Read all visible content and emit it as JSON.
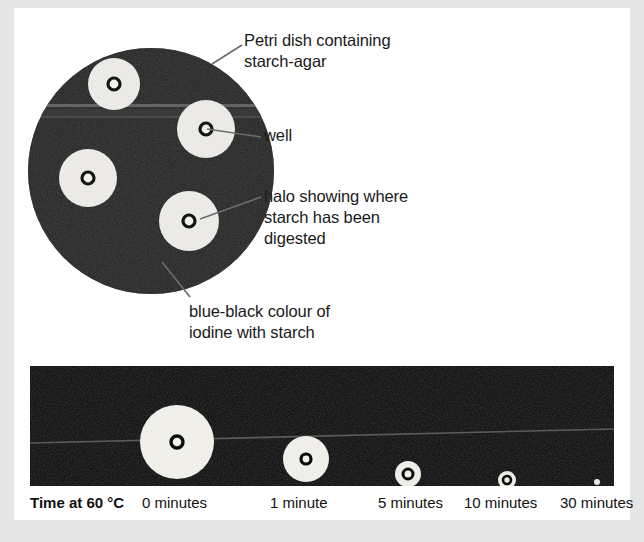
{
  "figure": {
    "colors": {
      "page_background": "#e6e6e6",
      "paper": "#ffffff",
      "agar_blue_black": "#141414",
      "halo_cream": "#ededea",
      "well_dark": "#111111",
      "text": "#1a1a1a",
      "leader_line": "#6d6d6d"
    }
  },
  "diagram": {
    "dish": {
      "center_x": 137,
      "center_y": 163,
      "radius": 123,
      "description": "Petri dish of starch-agar stained blue-black with iodine"
    },
    "halos": [
      {
        "name": "halo-top-left",
        "cx": 100,
        "cy": 76,
        "r": 26,
        "well_r": 6
      },
      {
        "name": "halo-right",
        "cx": 192,
        "cy": 121,
        "r": 29,
        "well_r": 6
      },
      {
        "name": "halo-left",
        "cx": 74,
        "cy": 170,
        "r": 29,
        "well_r": 6
      },
      {
        "name": "halo-bottom-right",
        "cx": 175,
        "cy": 213,
        "r": 30,
        "well_r": 6
      }
    ],
    "callouts": [
      {
        "id": "petri",
        "text": "Petri dish containing\nstarch-agar",
        "leader": {
          "x1": 228,
          "y1": 37,
          "x2": 198,
          "y2": 56
        }
      },
      {
        "id": "well",
        "text": "well",
        "leader": {
          "x1": 247,
          "y1": 129,
          "x2": 193,
          "y2": 121
        }
      },
      {
        "id": "halo",
        "text": "halo showing where\nstarch has been\ndigested",
        "leader": {
          "x1": 247,
          "y1": 189,
          "x2": 186,
          "y2": 211
        }
      },
      {
        "id": "iodine",
        "text": "blue-black colour of\niodine with starch",
        "leader": {
          "x1": 176,
          "y1": 289,
          "x2": 148,
          "y2": 254
        }
      }
    ]
  },
  "photo_strip": {
    "background": "#090909",
    "streak": {
      "y_left": 76,
      "y_right": 64,
      "color": "#6a6a6a"
    },
    "samples": [
      {
        "label": "0 minutes",
        "cx": 147,
        "cy": 76,
        "halo_r": 37,
        "well_r": 6
      },
      {
        "label": "1 minute",
        "cx": 276,
        "cy": 93,
        "halo_r": 23,
        "well_r": 5
      },
      {
        "label": "5 minutes",
        "cx": 378,
        "cy": 108,
        "halo_r": 13,
        "well_r": 5
      },
      {
        "label": "10 minutes",
        "cx": 477,
        "cy": 114,
        "halo_r": 9,
        "well_r": 4
      },
      {
        "label": "30 minutes",
        "cx": 567,
        "cy": 116,
        "halo_r": 3,
        "well_r": 0
      }
    ]
  },
  "time_axis": {
    "title": "Time at 60 °C",
    "ticks": [
      "0 minutes",
      "1 minute",
      "5 minutes",
      "10 minutes",
      "30 minutes"
    ]
  }
}
